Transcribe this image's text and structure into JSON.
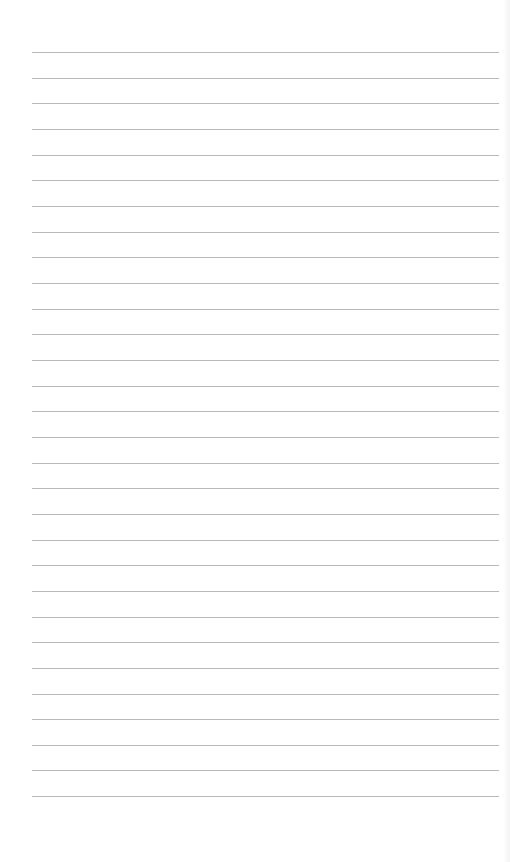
{
  "page": {
    "type": "lined-paper",
    "background_color": "#ffffff",
    "line_color": "#b9b9b9",
    "line_count": 30,
    "line_start_x": 32,
    "line_end_x": 499,
    "first_line_y": 52,
    "line_spacing": 25.66
  }
}
